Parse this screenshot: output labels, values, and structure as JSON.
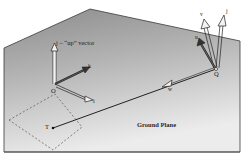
{
  "diagram": {
    "type": "3d-coordinate-frame-illustration",
    "plane_label": "Ground Plane",
    "up_vector_label": "j – “up” vector",
    "origin_label": "O",
    "origin_axes": {
      "k": "k",
      "i": "i"
    },
    "camera_point_label": "Q",
    "camera_axes": {
      "v": "v",
      "j": "j",
      "u": "u"
    },
    "view_vector_label": "w",
    "target_point_label": "T",
    "colors": {
      "plane_top": "#8f8f8f",
      "plane_bottom": "#e6e6e6",
      "edge": "#3a3a3a",
      "vector_fill": "#f2f2f2",
      "line": "#222222"
    }
  }
}
